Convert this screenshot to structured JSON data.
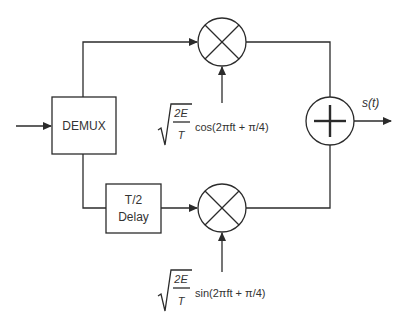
{
  "diagram": {
    "title": "",
    "blocks": {
      "demux": {
        "label": "DEMUX"
      },
      "delay": {
        "line1": "T/2",
        "line2": "Delay"
      },
      "multiplier_top": {
        "symbol": "multiply"
      },
      "multiplier_bottom": {
        "symbol": "multiply"
      },
      "summer": {
        "symbol": "add"
      }
    },
    "output": {
      "label": "s(t)"
    },
    "carriers": {
      "top": {
        "numerator": "2E",
        "denominator": "T",
        "func": "cos(2πft + π/4)"
      },
      "bottom": {
        "numerator": "2E",
        "denominator": "T",
        "func": "sin(2πft + π/4)"
      }
    },
    "colors": {
      "stroke": "#2b2b2b",
      "text": "#333333",
      "background": "#ffffff"
    }
  }
}
